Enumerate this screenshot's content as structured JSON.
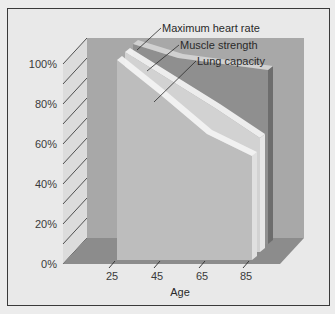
{
  "chart_data": {
    "type": "area",
    "title": "",
    "xlabel": "Age",
    "ylabel": "",
    "categories": [
      25,
      45,
      65,
      85
    ],
    "x_tick_labels": [
      "25",
      "45",
      "65",
      "85"
    ],
    "y_tick_labels": [
      "0%",
      "20%",
      "40%",
      "60%",
      "80%",
      "100%"
    ],
    "ylim": [
      0,
      100
    ],
    "grid": false,
    "legend_position": "annotations",
    "style": "3d-layered-area",
    "series": [
      {
        "name": "Maximum heart rate",
        "values": [
          100,
          93,
          90,
          87
        ]
      },
      {
        "name": "Muscle strength",
        "values": [
          100,
          86,
          72,
          57
        ]
      },
      {
        "name": "Lung capacity",
        "values": [
          100,
          82,
          63,
          52
        ]
      }
    ]
  },
  "colors": {
    "background": "#e9e9e9",
    "back_wall": "#a8a8a8",
    "side_wall": "#dcdcdc",
    "floor": "#8c8c8c",
    "heart_rate": "#8f8f8f",
    "muscle_strength": "#d2d2d2",
    "lung_capacity": "#bdbdbd",
    "edge_highlight": "#f2f2f2",
    "border": "#3a3a3a"
  }
}
